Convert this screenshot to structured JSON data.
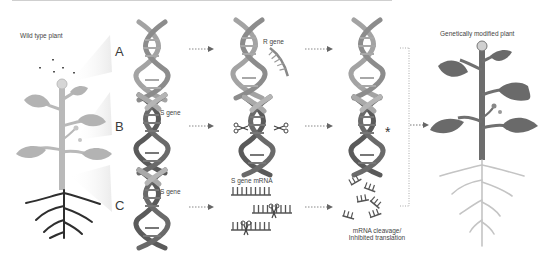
{
  "title_left": "Wild type plant",
  "title_right": "Genetically modified plant",
  "rows": [
    {
      "letter": "A",
      "gene_label": "",
      "mid_label": "R gene",
      "result": "Light DNA"
    },
    {
      "letter": "B",
      "gene_label": "S gene",
      "mid_label": "",
      "result_marker": "*"
    },
    {
      "letter": "C",
      "gene_label": "S gene",
      "mid_label": "S gene mRNA",
      "result_label_1": "mRNA cleavage/",
      "result_label_2": "Inhibited translation"
    }
  ],
  "colors": {
    "light_plant": "#b4b4b4",
    "dark_plant": "#6f6f6f",
    "dna_light": "#9a9a9a",
    "dna_dark": "#5e5e5e",
    "roots_dark": "#2f2f2f",
    "roots_light": "#c2c2c2",
    "arrow": "#777777",
    "cone": "#f2f2f2"
  }
}
